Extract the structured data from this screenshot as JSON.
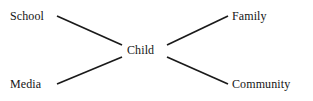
{
  "diagram": {
    "background_color": "#ffffff",
    "edge_color": "#1a1a1a",
    "text_color": "#141414",
    "nodes": [
      {
        "id": "school",
        "label": "School",
        "role": "peripheral",
        "x": 10,
        "y": 10
      },
      {
        "id": "media",
        "label": "Media",
        "role": "peripheral",
        "x": 10,
        "y": 78
      },
      {
        "id": "child",
        "label": "Child",
        "role": "center",
        "x": 127,
        "y": 44
      },
      {
        "id": "family",
        "label": "Family",
        "role": "peripheral",
        "x": 232,
        "y": 10
      },
      {
        "id": "community",
        "label": "Community",
        "role": "peripheral",
        "x": 232,
        "y": 78
      }
    ],
    "edges": [
      {
        "id": "school-child",
        "from": "school",
        "to": "child",
        "x1": 57,
        "y1": 16,
        "x2": 122,
        "y2": 45
      },
      {
        "id": "media-child",
        "from": "media",
        "to": "child",
        "x1": 57,
        "y1": 84,
        "x2": 122,
        "y2": 57
      },
      {
        "id": "child-family",
        "from": "child",
        "to": "family",
        "x1": 167,
        "y1": 45,
        "x2": 228,
        "y2": 16
      },
      {
        "id": "child-community",
        "from": "child",
        "to": "community",
        "x1": 167,
        "y1": 57,
        "x2": 228,
        "y2": 84
      }
    ]
  }
}
